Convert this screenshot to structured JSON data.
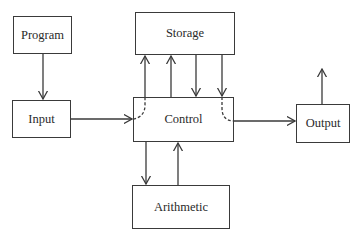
{
  "diagram": {
    "type": "block-diagram",
    "nodes": {
      "program": {
        "label": "Program"
      },
      "input": {
        "label": "Input"
      },
      "storage": {
        "label": "Storage"
      },
      "control": {
        "label": "Control"
      },
      "arithmetic": {
        "label": "Arithmetic"
      },
      "output": {
        "label": "Output"
      }
    },
    "edges": [
      {
        "from": "Program",
        "to": "Input",
        "style": "solid"
      },
      {
        "from": "Input",
        "to": "Control",
        "style": "solid"
      },
      {
        "from": "Input",
        "to": "Storage",
        "style": "dashed-curve-through-Control"
      },
      {
        "from": "Control",
        "to": "Storage",
        "style": "solid"
      },
      {
        "from": "Storage",
        "to": "Control",
        "style": "solid"
      },
      {
        "from": "Storage",
        "to": "Output",
        "style": "dashed-curve-through-Control"
      },
      {
        "from": "Control",
        "to": "Output",
        "style": "solid"
      },
      {
        "from": "Output",
        "to": "external",
        "style": "solid"
      },
      {
        "from": "Control",
        "to": "Arithmetic",
        "style": "solid"
      },
      {
        "from": "Arithmetic",
        "to": "Control",
        "style": "solid"
      }
    ],
    "colors": {
      "line": "#3a3a3a",
      "background": "#ffffff",
      "text": "#2a2a2a"
    }
  }
}
